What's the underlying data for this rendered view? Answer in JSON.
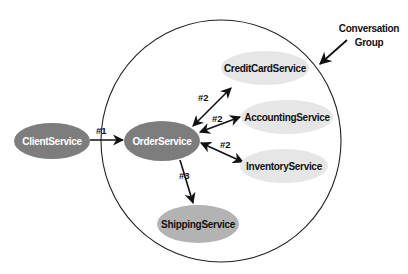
{
  "diagram": {
    "group": {
      "label_line1": "Conversation",
      "label_line2": "Group"
    },
    "nodes": {
      "client": {
        "label": "ClientService",
        "fill": "#7d7d7d",
        "text_color": "#ffffff"
      },
      "order": {
        "label": "OrderService",
        "fill": "#7d7d7d",
        "text_color": "#ffffff"
      },
      "creditcard": {
        "label": "CreditCardService",
        "fill": "#e6e6e6",
        "text_color": "#111111"
      },
      "accounting": {
        "label": "AccountingService",
        "fill": "#e6e6e6",
        "text_color": "#111111"
      },
      "inventory": {
        "label": "InventoryService",
        "fill": "#e6e6e6",
        "text_color": "#111111"
      },
      "shipping": {
        "label": "ShippingService",
        "fill": "#b3b3b3",
        "text_color": "#111111"
      }
    },
    "edges": {
      "client_order": {
        "label": "#1",
        "from": "ClientService",
        "to": "OrderService",
        "direction": "one-way"
      },
      "order_creditcard": {
        "label": "#2",
        "from": "OrderService",
        "to": "CreditCardService",
        "direction": "two-way"
      },
      "order_accounting": {
        "label": "#2",
        "from": "OrderService",
        "to": "AccountingService",
        "direction": "two-way"
      },
      "order_inventory": {
        "label": "#2",
        "from": "OrderService",
        "to": "InventoryService",
        "direction": "two-way"
      },
      "order_shipping": {
        "label": "#3",
        "from": "OrderService",
        "to": "ShippingService",
        "direction": "one-way"
      }
    }
  }
}
